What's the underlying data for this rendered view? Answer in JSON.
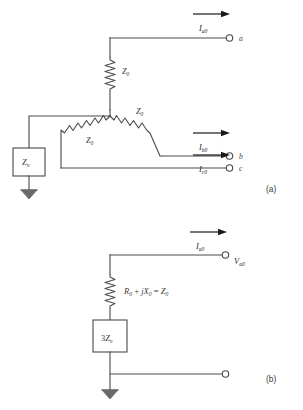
{
  "figure": {
    "panels": [
      {
        "id": "panel-a",
        "label": "(a)"
      },
      {
        "id": "panel-b",
        "label": "(b)"
      }
    ]
  },
  "panel_a": {
    "label": "(a)",
    "terminals": [
      {
        "name": "terminal-a",
        "label": "a"
      },
      {
        "name": "terminal-b",
        "label": "b"
      },
      {
        "name": "terminal-c",
        "label": "c"
      }
    ],
    "currents": [
      {
        "name": "current-a0",
        "symbol": "I",
        "subscript": "a0"
      },
      {
        "name": "current-b0",
        "symbol": "I",
        "subscript": "b0"
      },
      {
        "name": "current-c0",
        "symbol": "I",
        "subscript": "c0"
      }
    ],
    "impedances": [
      {
        "name": "impedance-phase-a",
        "symbol": "Z",
        "subscript": "0"
      },
      {
        "name": "impedance-phase-b",
        "symbol": "Z",
        "subscript": "0"
      },
      {
        "name": "impedance-phase-c",
        "symbol": "Z",
        "subscript": "0"
      }
    ],
    "neutral_impedance": {
      "symbol": "Z",
      "subscript": "n"
    },
    "ground": "ground-symbol"
  },
  "panel_b": {
    "label": "(b)",
    "current": {
      "name": "current-a0",
      "symbol": "I",
      "subscript": "a0"
    },
    "voltage": {
      "name": "voltage-a0",
      "symbol": "V",
      "subscript": "a0"
    },
    "series_impedance": {
      "name": "series-impedance-equation",
      "r_symbol": "R",
      "r_subscript": "0",
      "plus": "+",
      "j_symbol": "j",
      "x_symbol": "X",
      "x_subscript": "0",
      "equals": "=",
      "z_symbol": "Z",
      "z_subscript": "0"
    },
    "neutral_box": {
      "prefix": "3",
      "symbol": "Z",
      "subscript": "n"
    },
    "ground": "ground-symbol",
    "reference_terminal": "reference-terminal"
  },
  "colors": {
    "wire": "#4a4a4a",
    "arrow": "#1a1a1a",
    "text": "#3d3d3d",
    "background": "#ffffff"
  }
}
